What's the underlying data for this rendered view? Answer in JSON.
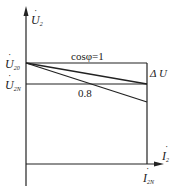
{
  "diagram": {
    "type": "external-characteristic",
    "y_axis_label": {
      "symbol": "U",
      "sub": "2",
      "dot": "˙"
    },
    "x_axis_label": {
      "symbol": "I",
      "sub": "2",
      "dot": "˙"
    },
    "levels": {
      "u20": {
        "symbol": "U",
        "sub": "20",
        "dot": "˙"
      },
      "u2n": {
        "symbol": "U",
        "sub": "2N",
        "dot": "˙"
      }
    },
    "x_mark": {
      "symbol": "I",
      "sub": "2N",
      "dot": "˙"
    },
    "curves": [
      {
        "label": "cosφ=1",
        "start": "U20",
        "end_at_I2N": "U2N"
      },
      {
        "label": "0.8",
        "start": "U20",
        "end_at_I2N": "below U2N"
      }
    ],
    "delta_label": "Δ U",
    "colors": {
      "line": "#222222",
      "background": "#ffffff"
    }
  }
}
